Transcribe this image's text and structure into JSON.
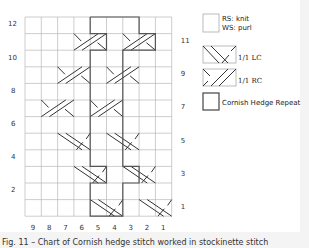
{
  "chart": {
    "columns": 9,
    "rows": 12,
    "column_labels": [
      "9",
      "8",
      "7",
      "6",
      "5",
      "4",
      "3",
      "2",
      "1"
    ],
    "left_row_labels": [
      {
        "row": 12,
        "label": "12"
      },
      {
        "row": 10,
        "label": "10"
      },
      {
        "row": 8,
        "label": "8"
      },
      {
        "row": 6,
        "label": "6"
      },
      {
        "row": 4,
        "label": "4"
      },
      {
        "row": 2,
        "label": "2"
      }
    ],
    "right_row_labels": [
      {
        "row": 11,
        "label": "11"
      },
      {
        "row": 9,
        "label": "9"
      },
      {
        "row": 7,
        "label": "7"
      },
      {
        "row": 5,
        "label": "5"
      },
      {
        "row": 3,
        "label": "3"
      },
      {
        "row": 1,
        "label": "1"
      }
    ],
    "cables": [
      {
        "row": 1,
        "type": "LC",
        "start_col_index": 4
      },
      {
        "row": 1,
        "type": "LC",
        "start_col_index": 7
      },
      {
        "row": 3,
        "type": "LC",
        "start_col_index": 3
      },
      {
        "row": 3,
        "type": "LC",
        "start_col_index": 6
      },
      {
        "row": 5,
        "type": "LC",
        "start_col_index": 2
      },
      {
        "row": 5,
        "type": "LC",
        "start_col_index": 5
      },
      {
        "row": 7,
        "type": "RC",
        "start_col_index": 1
      },
      {
        "row": 7,
        "type": "RC",
        "start_col_index": 4
      },
      {
        "row": 9,
        "type": "RC",
        "start_col_index": 2
      },
      {
        "row": 9,
        "type": "RC",
        "start_col_index": 5
      },
      {
        "row": 11,
        "type": "RC",
        "start_col_index": 3
      },
      {
        "row": 11,
        "type": "RC",
        "start_col_index": 6
      }
    ],
    "colors": {
      "grid": "#b8b8b8",
      "stroke": "#333333",
      "repeat_outline": "#555555"
    }
  },
  "legend": {
    "items": [
      {
        "key": "knit",
        "line1": "RS: knit",
        "line2": "WS: purl"
      },
      {
        "key": "lc",
        "label": "1/1 LC"
      },
      {
        "key": "rc",
        "label": "1/1 RC"
      },
      {
        "key": "repeat",
        "label": "Cornish Hedge Repeat"
      }
    ]
  },
  "caption": "Fig. 11 – Chart of Cornish hedge stitch worked in stockinette stitch"
}
